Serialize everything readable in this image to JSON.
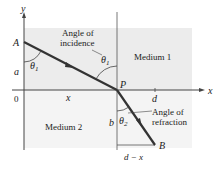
{
  "diagram": {
    "axes": {
      "x_label": "x",
      "y_label": "y",
      "origin_label": "0"
    },
    "points": {
      "A": "A",
      "P": "P",
      "B": "B"
    },
    "media": {
      "medium1": "Medium 1",
      "medium2": "Medium 2"
    },
    "segments": {
      "a": "a",
      "b": "b",
      "x": "x",
      "d": "d",
      "d_minus_x": "d − x"
    },
    "angles": {
      "theta1": "θ",
      "theta1_sub": "1",
      "theta2": "θ",
      "theta2_sub": "2",
      "incidence_line1": "Angle of",
      "incidence_line2": "incidence",
      "refraction_line1": "Angle of",
      "refraction_line2": "refraction"
    },
    "colors": {
      "medium1_fill": "#ececec",
      "medium2_fill": "#f3f3f3",
      "ray": "#333333",
      "axis": "#444444"
    }
  }
}
